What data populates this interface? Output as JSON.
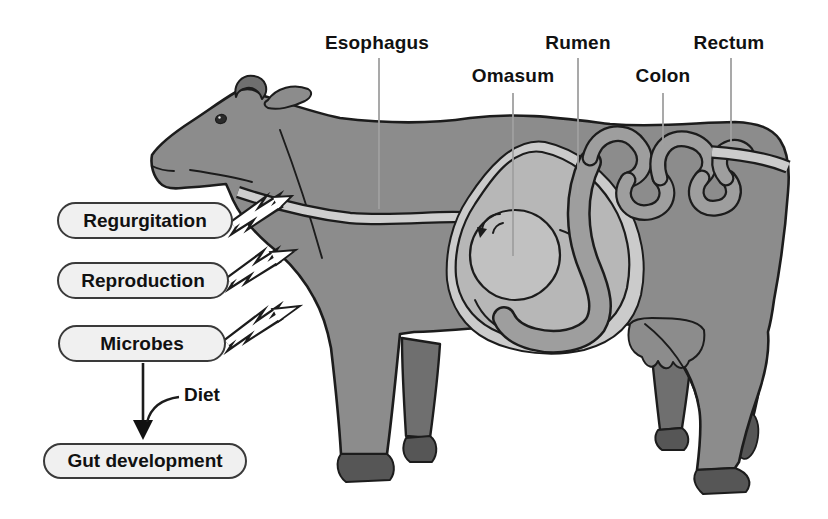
{
  "figure": {
    "organ_labels": [
      {
        "id": "esophagus",
        "label": "Esophagus"
      },
      {
        "id": "omasum",
        "label": "Omasum"
      },
      {
        "id": "rumen",
        "label": "Rumen"
      },
      {
        "id": "colon",
        "label": "Colon"
      },
      {
        "id": "rectum",
        "label": "Rectum"
      }
    ],
    "process_labels": [
      {
        "id": "regurgitation",
        "label": "Regurgitation"
      },
      {
        "id": "reproduction",
        "label": "Reproduction"
      },
      {
        "id": "microbes",
        "label": "Microbes"
      }
    ],
    "flow": {
      "diet_label": "Diet",
      "result_label": "Gut development"
    },
    "colors": {
      "body": "#8c8c8c",
      "body_dark": "#6f6f6f",
      "hoof": "#565656",
      "outline": "#1c1c1c",
      "rumen": "#b7b7b7",
      "omasum": "#c1c1c1",
      "membrane": "#cbcbcb",
      "esophagus": "#cfcfcf",
      "intestine": "#9e9e9e",
      "tail": "#c4c4c4",
      "pill_fill": "#f0f0f0",
      "pill_border": "#3a3a3a",
      "pointer_line": "#a0a0a0",
      "text": "#111111",
      "background": "#ffffff"
    }
  }
}
